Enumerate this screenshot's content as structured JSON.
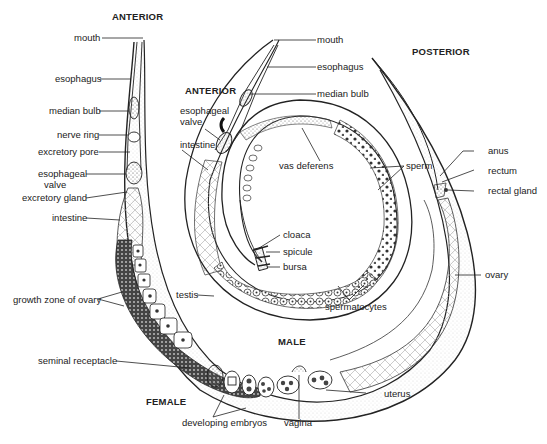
{
  "diagram": {
    "headings": {
      "female_anterior": "ANTERIOR",
      "male_anterior": "ANTERIOR",
      "posterior": "POSTERIOR",
      "male": "MALE",
      "female": "FEMALE"
    },
    "female_labels": {
      "mouth": "mouth",
      "esophagus": "esophagus",
      "median_bulb": "median bulb",
      "nerve_ring": "nerve ring",
      "excretory_pore": "excretory pore",
      "esophageal_valve_1": "esophageal",
      "esophageal_valve_2": "valve",
      "excretory_gland": "excretory gland",
      "intestine": "intestine",
      "growth_zone": "growth zone of ovary",
      "seminal_receptacle": "seminal receptacle",
      "developing_embryos": "developing embryos",
      "vagina": "vagina",
      "uterus": "uterus",
      "ovary": "ovary",
      "anus": "anus",
      "rectum": "rectum",
      "rectal_gland": "rectal gland"
    },
    "male_labels": {
      "mouth": "mouth",
      "esophagus": "esophagus",
      "median_bulb": "median bulb",
      "esophageal_valve_1": "esophageal",
      "esophageal_valve_2": "valve",
      "intestine": "intestine",
      "vas_deferens": "vas deferens",
      "sperm": "sperm",
      "cloaca": "cloaca",
      "spicule": "spicule",
      "bursa": "bursa",
      "testis": "testis",
      "spermatocytes": "spermatocytes"
    },
    "colors": {
      "ink": "#222222",
      "background": "#ffffff",
      "stipple": "#555555"
    }
  }
}
